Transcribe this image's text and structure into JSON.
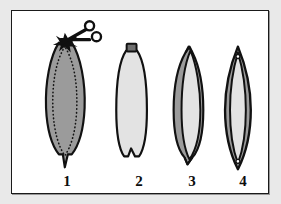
{
  "figure": {
    "panel_name": "surgical-incision-closure-sequence",
    "background_color": "#ffffff",
    "outer_background_color": "#e9e9e9",
    "border_color": "#1a1a1a",
    "tool_icon": "scissors-icon",
    "fill_dark_gray": "#9b9b9b",
    "fill_light_gray": "#e3e3e3",
    "fill_mid_gray": "#a8a8a8",
    "outline_color": "#111111",
    "dotted_line_color": "#141414",
    "steps": [
      {
        "label": "1",
        "name": "step-1-incision-with-scissors",
        "shape": "oval-tissue-with-dotted-excision-outline",
        "fill": "#9b9b9b",
        "has_scissors": true,
        "has_dotted_outline": true,
        "has_bottom_point": true
      },
      {
        "label": "2",
        "name": "step-2-excised-tissue-flap",
        "shape": "rounded-flap-with-top-tab-and-bottom-notch",
        "fill": "#e3e3e3",
        "has_scissors": false,
        "has_dotted_outline": false,
        "has_top_tab": true,
        "has_bottom_notch": true
      },
      {
        "label": "3",
        "name": "step-3-partially-folded-flap",
        "shape": "crescent-fold-with-notches",
        "fill": "#e3e3e3",
        "fold_fill": "#9b9b9b",
        "has_scissors": false,
        "has_dotted_outline": false
      },
      {
        "label": "4",
        "name": "step-4-closed-lens-suture",
        "shape": "narrow-lens-with-apex-holes",
        "fill": "#e3e3e3",
        "fold_fill": "#9b9b9b",
        "has_scissors": false,
        "has_dotted_outline": false,
        "has_apex_holes": true
      }
    ]
  }
}
